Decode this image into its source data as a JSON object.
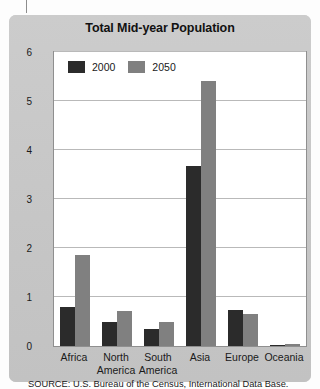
{
  "chart_data": {
    "type": "bar",
    "title": "Total Mid-year Population",
    "xlabel": "",
    "ylabel": "Population (Billions)",
    "ylim": [
      0,
      6
    ],
    "yticks": [
      0,
      1,
      2,
      3,
      4,
      5,
      6
    ],
    "grid": true,
    "legend_position": "top-left",
    "categories": [
      "Africa",
      "North\nAmerica",
      "South\nAmerica",
      "Asia",
      "Europe",
      "Oceania"
    ],
    "series": [
      {
        "name": "2000",
        "color": "#2b2b2b",
        "values": [
          0.8,
          0.48,
          0.35,
          3.68,
          0.73,
          0.03
        ]
      },
      {
        "name": "2050",
        "color": "#808080",
        "values": [
          1.85,
          0.72,
          0.5,
          5.4,
          0.66,
          0.05
        ]
      }
    ],
    "source": "SOURCE: U.S. Bureau of the Census, International Data Base."
  },
  "legend": {
    "items": [
      {
        "label": "2000",
        "color": "#2b2b2b"
      },
      {
        "label": "2050",
        "color": "#808080"
      }
    ]
  },
  "axis": {
    "y_title": "Population (Billions)",
    "y_ticks": [
      "6",
      "5",
      "4",
      "3",
      "2",
      "1",
      "0"
    ]
  },
  "footer": {
    "source": "SOURCE: U.S. Bureau of the Census, International Data Base."
  },
  "header": {
    "title": "Total Mid-year Population"
  }
}
